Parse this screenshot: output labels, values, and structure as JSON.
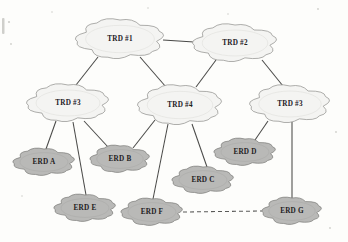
{
  "diagram": {
    "background_color": "#fdfdfb",
    "trd_fill": "#f4f4f2",
    "erd_fill": "#b9b9b7",
    "line_color": "#4a4a48",
    "nodes": [
      {
        "id": "trd1",
        "label": "TRD #1",
        "type": "TRD",
        "cx": 120,
        "cy": 39,
        "rx": 43,
        "ry": 19
      },
      {
        "id": "trd2",
        "label": "TRD #2",
        "type": "TRD",
        "cx": 235,
        "cy": 43,
        "rx": 41,
        "ry": 18
      },
      {
        "id": "trd3l",
        "label": "TRD #3",
        "type": "TRD",
        "cx": 68,
        "cy": 103,
        "rx": 40,
        "ry": 18
      },
      {
        "id": "trd4",
        "label": "TRD #4",
        "type": "TRD",
        "cx": 180,
        "cy": 105,
        "rx": 41,
        "ry": 19
      },
      {
        "id": "trd3r",
        "label": "TRD #3",
        "type": "TRD",
        "cx": 290,
        "cy": 104,
        "rx": 39,
        "ry": 18
      },
      {
        "id": "erda",
        "label": "ERD A",
        "type": "ERD",
        "cx": 44,
        "cy": 162,
        "rx": 30,
        "ry": 13
      },
      {
        "id": "erdb",
        "label": "ERD B",
        "type": "ERD",
        "cx": 120,
        "cy": 159,
        "rx": 29,
        "ry": 13
      },
      {
        "id": "erdc",
        "label": "ERD C",
        "type": "ERD",
        "cx": 203,
        "cy": 180,
        "rx": 30,
        "ry": 13
      },
      {
        "id": "erdd",
        "label": "ERD D",
        "type": "ERD",
        "cx": 245,
        "cy": 152,
        "rx": 30,
        "ry": 13
      },
      {
        "id": "erde",
        "label": "ERD E",
        "type": "ERD",
        "cx": 85,
        "cy": 208,
        "rx": 30,
        "ry": 13
      },
      {
        "id": "erdf",
        "label": "ERD F",
        "type": "ERD",
        "cx": 152,
        "cy": 212,
        "rx": 30,
        "ry": 13
      },
      {
        "id": "erdg",
        "label": "ERD G",
        "type": "ERD",
        "cx": 292,
        "cy": 211,
        "rx": 29,
        "ry": 13
      }
    ],
    "links": [
      {
        "from": "trd1",
        "to": "trd2",
        "style": "solid",
        "x1": 163,
        "y1": 40,
        "x2": 194,
        "y2": 42
      },
      {
        "from": "trd1",
        "to": "trd3l",
        "style": "solid",
        "x1": 98,
        "y1": 57,
        "x2": 76,
        "y2": 85
      },
      {
        "from": "trd1",
        "to": "trd4",
        "style": "solid",
        "x1": 140,
        "y1": 57,
        "x2": 166,
        "y2": 87
      },
      {
        "from": "trd2",
        "to": "trd4",
        "style": "solid",
        "x1": 216,
        "y1": 60,
        "x2": 196,
        "y2": 87
      },
      {
        "from": "trd2",
        "to": "trd3r",
        "style": "solid",
        "x1": 262,
        "y1": 60,
        "x2": 283,
        "y2": 86
      },
      {
        "from": "trd3l",
        "to": "erda",
        "style": "solid",
        "x1": 56,
        "y1": 121,
        "x2": 46,
        "y2": 149
      },
      {
        "from": "trd3l",
        "to": "erdb",
        "style": "solid",
        "x1": 84,
        "y1": 121,
        "x2": 108,
        "y2": 147
      },
      {
        "from": "trd3l",
        "to": "erde",
        "style": "solid",
        "x1": 73,
        "y1": 122,
        "x2": 86,
        "y2": 195
      },
      {
        "from": "trd4",
        "to": "erdb",
        "style": "solid",
        "x1": 155,
        "y1": 120,
        "x2": 133,
        "y2": 148
      },
      {
        "from": "trd4",
        "to": "erdf",
        "style": "solid",
        "x1": 168,
        "y1": 124,
        "x2": 153,
        "y2": 199
      },
      {
        "from": "trd4",
        "to": "erdc",
        "style": "solid",
        "x1": 192,
        "y1": 124,
        "x2": 207,
        "y2": 167
      },
      {
        "from": "trd3r",
        "to": "erdd",
        "style": "solid",
        "x1": 268,
        "y1": 121,
        "x2": 255,
        "y2": 140
      },
      {
        "from": "trd3r",
        "to": "erdg",
        "style": "solid",
        "x1": 292,
        "y1": 122,
        "x2": 292,
        "y2": 198
      },
      {
        "from": "erdf",
        "to": "erdg",
        "style": "dashed",
        "x1": 183,
        "y1": 212,
        "x2": 262,
        "y2": 211
      }
    ]
  }
}
